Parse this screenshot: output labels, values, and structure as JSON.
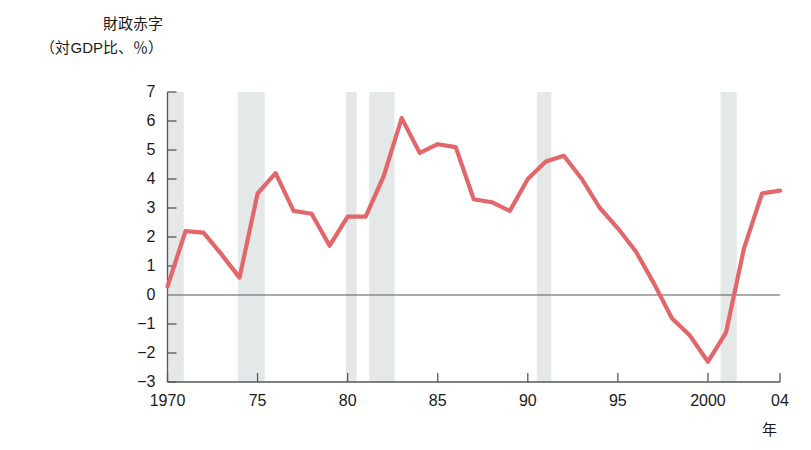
{
  "chart_data": {
    "type": "line",
    "title": "",
    "ylabel_lines": [
      "財政赤字",
      "（対GDP比、％）"
    ],
    "xlabel": "年",
    "ylim": [
      -3,
      7
    ],
    "xlim": [
      1970,
      2004
    ],
    "grid": false,
    "legend": "none",
    "line_color": "#e2666a",
    "zero_line_color": "#55585c",
    "axis_color": "#55585c",
    "recession_band_color": "#e4e8e8",
    "ytick_labels": [
      "7",
      "6",
      "5",
      "4",
      "3",
      "2",
      "1",
      "0",
      "−1",
      "−2",
      "−3"
    ],
    "ytick_values": [
      7,
      6,
      5,
      4,
      3,
      2,
      1,
      0,
      -1,
      -2,
      -3
    ],
    "xtick_labels": [
      "1970",
      "75",
      "80",
      "85",
      "90",
      "95",
      "2000",
      "04"
    ],
    "xtick_values": [
      1970,
      1975,
      1980,
      1985,
      1990,
      1995,
      2000,
      2004
    ],
    "x": [
      1970,
      1971,
      1972,
      1973,
      1974,
      1975,
      1976,
      1977,
      1978,
      1979,
      1980,
      1981,
      1982,
      1983,
      1984,
      1985,
      1986,
      1987,
      1988,
      1989,
      1990,
      1991,
      1992,
      1993,
      1994,
      1995,
      1996,
      1997,
      1998,
      1999,
      2000,
      2001,
      2002,
      2003,
      2004
    ],
    "values": [
      0.3,
      2.2,
      2.15,
      1.4,
      0.6,
      3.5,
      4.2,
      2.9,
      2.8,
      1.7,
      2.7,
      2.7,
      4.1,
      6.1,
      4.9,
      5.2,
      5.1,
      3.3,
      3.2,
      2.9,
      4.0,
      4.6,
      4.8,
      4.0,
      3.0,
      2.3,
      1.5,
      0.4,
      -0.8,
      -1.4,
      -2.3,
      -1.3,
      1.6,
      3.5,
      3.6
    ],
    "recession_bands": [
      {
        "start": 1970.0,
        "end": 1970.9
      },
      {
        "start": 1973.9,
        "end": 1975.4
      },
      {
        "start": 1979.9,
        "end": 1980.5
      },
      {
        "start": 1981.2,
        "end": 1982.6
      },
      {
        "start": 1990.5,
        "end": 1991.3
      },
      {
        "start": 2000.7,
        "end": 2001.6
      }
    ]
  }
}
